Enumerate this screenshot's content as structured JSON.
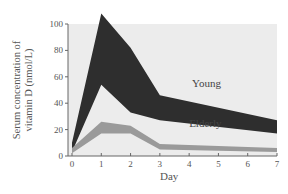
{
  "chart_data": {
    "type": "area",
    "title": "",
    "xlabel": "Day",
    "ylabel": "Serum concentration of vitamin D (nmol/L)",
    "ylabel_lines": [
      "Serum concentration of",
      "vitamin D (nmol/L)"
    ],
    "x": [
      0,
      1,
      2,
      3,
      7
    ],
    "x_ticks": [
      0,
      1,
      2,
      3,
      4,
      5,
      6,
      7
    ],
    "y_ticks": [
      0,
      20,
      40,
      60,
      80,
      100
    ],
    "xlim": [
      0,
      7
    ],
    "ylim": [
      0,
      100
    ],
    "grid": false,
    "legend": "inline labels",
    "series": [
      {
        "name": "Young",
        "type": "range band",
        "upper": [
          10,
          108,
          82,
          46,
          27
        ],
        "lower": [
          3,
          54,
          33,
          27,
          17
        ],
        "color": "#2e2e2e"
      },
      {
        "name": "Elderly",
        "type": "range band",
        "upper": [
          6,
          26,
          23,
          9,
          6
        ],
        "lower": [
          2,
          17,
          17,
          5,
          3
        ],
        "color": "#9a9a9a"
      }
    ],
    "annotations": [
      {
        "text": "Young",
        "x": 4.1,
        "y": 52
      },
      {
        "text": "Elderly",
        "x": 4.0,
        "y": 22
      }
    ]
  },
  "colors": {
    "plot_background": "#ececec",
    "axis": "#666666"
  }
}
